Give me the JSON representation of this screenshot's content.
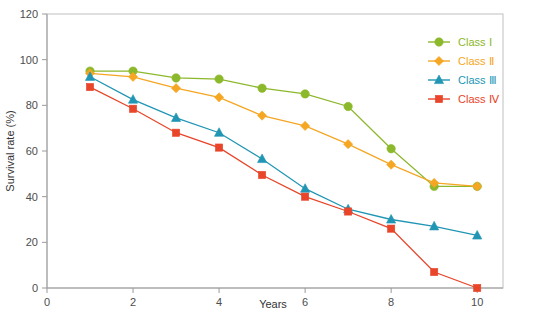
{
  "chart_data": {
    "type": "line",
    "title": "",
    "xlabel": "Years",
    "ylabel": "Survival rate (%)",
    "xlim": [
      0,
      10.6
    ],
    "ylim": [
      0,
      120
    ],
    "xticks": [
      0,
      2,
      4,
      6,
      8,
      10
    ],
    "yticks": [
      0,
      20,
      40,
      60,
      80,
      100,
      120
    ],
    "xtick_labels": [
      "0",
      "2",
      "4",
      "6",
      "8",
      "10"
    ],
    "ytick_labels": [
      "0",
      "20",
      "40",
      "60",
      "80",
      "100",
      "120"
    ],
    "grid": false,
    "legend_position": "top-right",
    "x": [
      1,
      2,
      3,
      4,
      5,
      6,
      7,
      8,
      9,
      10
    ],
    "series": [
      {
        "name": "Class Ⅰ",
        "color": "#8CB82B",
        "marker": "circle",
        "values": [
          95,
          95,
          92,
          91.5,
          87.5,
          85,
          79.5,
          61,
          44.5,
          44.5
        ]
      },
      {
        "name": "Class Ⅱ",
        "color": "#F5A623",
        "marker": "diamond",
        "values": [
          94,
          92.5,
          87.5,
          83.5,
          75.5,
          71,
          63,
          54,
          46,
          44.5
        ]
      },
      {
        "name": "Class Ⅲ",
        "color": "#2196B4",
        "marker": "triangle",
        "values": [
          92.5,
          82.5,
          74.5,
          68,
          56.5,
          43.5,
          34.5,
          30,
          27,
          23
        ]
      },
      {
        "name": "Class Ⅳ",
        "color": "#E8452A",
        "marker": "square",
        "values": [
          88,
          78.5,
          68,
          61.5,
          49.5,
          40,
          33.5,
          26,
          7,
          0
        ]
      }
    ]
  },
  "legend": {
    "items": [
      {
        "label": "Class Ⅰ",
        "color": "#8CB82B"
      },
      {
        "label": "Class Ⅱ",
        "color": "#F5A623"
      },
      {
        "label": "Class Ⅲ",
        "color": "#2196B4"
      },
      {
        "label": "Class Ⅳ",
        "color": "#E8452A"
      }
    ]
  },
  "axes": {
    "x_title": "Years",
    "y_title": "Survival rate (%)"
  }
}
